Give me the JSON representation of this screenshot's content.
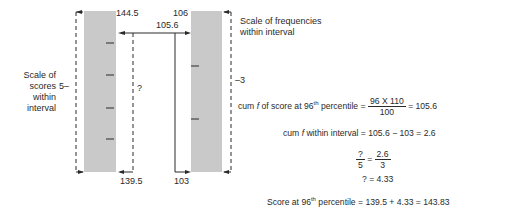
{
  "diagram": {
    "left_bar": {
      "top_label": "144.5",
      "bottom_label": "139.5",
      "scale_label": [
        "Scale of",
        "scores",
        "within",
        "interval"
      ],
      "scale_tick_label": "5",
      "unknown_label": "?",
      "ticks": 4
    },
    "right_bar": {
      "top_label": "106",
      "bottom_label": "103",
      "scale_label": [
        "Scale of frequencies",
        "within interval"
      ],
      "scale_tick_label": "3",
      "ticks": 2
    },
    "connector_label": "105.6",
    "colors": {
      "bar": "#c9c9c9",
      "line": "#2a2a2a"
    }
  },
  "equations": {
    "eq1": {
      "prefix": "cum ",
      "f": "f",
      "mid": " of score at 96",
      "sup": "th",
      "suffix": " percentile  =",
      "num": "96  X  110",
      "den": "100",
      "result": "=  105.6"
    },
    "eq2": {
      "prefix": "cum ",
      "f": "f",
      "rest": " within interval  =  105.6  − 103  =  2.6"
    },
    "eq3": {
      "num1": "?",
      "den1": "5",
      "eq": "=",
      "num2": "2.6",
      "den2": "3"
    },
    "eq4": {
      "text": "?  =  4.33"
    },
    "eq5": {
      "prefix": "Score at 96",
      "sup": "th",
      "rest": " percentile  =  139.5  +  4.33  =  143.83"
    }
  }
}
